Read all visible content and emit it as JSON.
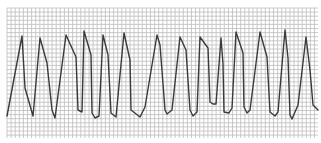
{
  "figure": {
    "label": "ECG rhythm strip",
    "paper_color": "#ffffff",
    "grid_color": "#bcbcbc",
    "trace_color": "#3a3a3a",
    "grid": {
      "x0": 7,
      "y0": 8,
      "x1": 318,
      "y1": 138,
      "step": 4.1
    },
    "trace_points": [
      [
        7,
        116
      ],
      [
        22,
        36
      ],
      [
        25,
        88
      ],
      [
        33,
        116
      ],
      [
        40,
        38
      ],
      [
        47,
        63
      ],
      [
        52,
        110
      ],
      [
        55,
        118
      ],
      [
        66,
        35
      ],
      [
        76,
        57
      ],
      [
        78,
        110
      ],
      [
        82,
        112
      ],
      [
        84,
        31
      ],
      [
        91,
        55
      ],
      [
        92,
        113
      ],
      [
        95,
        118
      ],
      [
        99,
        116
      ],
      [
        103,
        35
      ],
      [
        108,
        55
      ],
      [
        111,
        113
      ],
      [
        116,
        117
      ],
      [
        124,
        33
      ],
      [
        130,
        60
      ],
      [
        131,
        110
      ],
      [
        140,
        117
      ],
      [
        145,
        107
      ],
      [
        157,
        35
      ],
      [
        160,
        45
      ],
      [
        165,
        110
      ],
      [
        167,
        114
      ],
      [
        172,
        110
      ],
      [
        180,
        37
      ],
      [
        186,
        50
      ],
      [
        190,
        110
      ],
      [
        193,
        116
      ],
      [
        197,
        112
      ],
      [
        200,
        37
      ],
      [
        208,
        48
      ],
      [
        210,
        102
      ],
      [
        213,
        104
      ],
      [
        216,
        104
      ],
      [
        221,
        38
      ],
      [
        223,
        64
      ],
      [
        224,
        112
      ],
      [
        229,
        113
      ],
      [
        232,
        108
      ],
      [
        236,
        32
      ],
      [
        243,
        53
      ],
      [
        244,
        107
      ],
      [
        247,
        113
      ],
      [
        250,
        110
      ],
      [
        260,
        32
      ],
      [
        267,
        57
      ],
      [
        270,
        112
      ],
      [
        275,
        116
      ],
      [
        278,
        112
      ],
      [
        285,
        30
      ],
      [
        288,
        58
      ],
      [
        290,
        115
      ],
      [
        292,
        119
      ],
      [
        298,
        105
      ],
      [
        306,
        37
      ],
      [
        310,
        70
      ],
      [
        313,
        105
      ],
      [
        318,
        110
      ]
    ]
  }
}
